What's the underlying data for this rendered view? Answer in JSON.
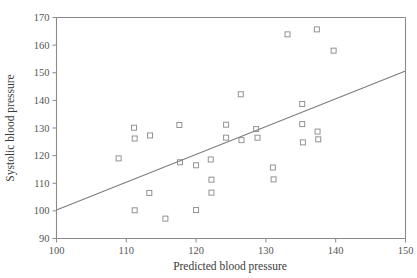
{
  "chart_data": {
    "type": "scatter",
    "title": "",
    "xlabel": "Predicted blood pressure",
    "ylabel": "Systolic blood pressure",
    "xlim": [
      100,
      150
    ],
    "ylim": [
      90,
      170
    ],
    "xticks": [
      100,
      110,
      120,
      130,
      140,
      150
    ],
    "yticks": [
      90,
      100,
      110,
      120,
      130,
      140,
      150,
      160,
      170
    ],
    "xtick_labels": [
      "100",
      "110",
      "120",
      "130",
      "140",
      "150"
    ],
    "ytick_labels": [
      "90",
      "100",
      "110",
      "120",
      "130",
      "140",
      "150",
      "160",
      "170"
    ],
    "grid": false,
    "legend": null,
    "marker_style": "open-square",
    "marker_color": "#8d8d8d",
    "points": [
      {
        "x": 108.9,
        "y": 119.0
      },
      {
        "x": 111.1,
        "y": 130.1
      },
      {
        "x": 111.2,
        "y": 126.2
      },
      {
        "x": 113.4,
        "y": 127.3
      },
      {
        "x": 111.2,
        "y": 100.2
      },
      {
        "x": 113.3,
        "y": 106.5
      },
      {
        "x": 115.6,
        "y": 97.2
      },
      {
        "x": 117.6,
        "y": 131.1
      },
      {
        "x": 117.7,
        "y": 117.6
      },
      {
        "x": 120.0,
        "y": 116.5
      },
      {
        "x": 120.0,
        "y": 100.3
      },
      {
        "x": 122.1,
        "y": 118.6
      },
      {
        "x": 122.2,
        "y": 111.3
      },
      {
        "x": 122.2,
        "y": 106.6
      },
      {
        "x": 124.3,
        "y": 131.2
      },
      {
        "x": 124.3,
        "y": 126.5
      },
      {
        "x": 126.4,
        "y": 142.2
      },
      {
        "x": 126.5,
        "y": 125.6
      },
      {
        "x": 128.6,
        "y": 129.6
      },
      {
        "x": 128.8,
        "y": 126.5
      },
      {
        "x": 131.0,
        "y": 115.7
      },
      {
        "x": 131.1,
        "y": 111.4
      },
      {
        "x": 133.1,
        "y": 163.9
      },
      {
        "x": 135.2,
        "y": 138.7
      },
      {
        "x": 135.2,
        "y": 131.4
      },
      {
        "x": 135.3,
        "y": 124.8
      },
      {
        "x": 137.3,
        "y": 165.7
      },
      {
        "x": 137.4,
        "y": 128.7
      },
      {
        "x": 137.5,
        "y": 125.9
      },
      {
        "x": 139.7,
        "y": 158.0
      }
    ],
    "trend_line": {
      "x": [
        100,
        150
      ],
      "y": [
        100.3,
        150.6
      ],
      "color": "#7b7b7b"
    }
  },
  "colors": {
    "background": "#ffffff",
    "axis": "#8a8a8a",
    "text": "#4a4a4a",
    "marker": "#8d8d8d",
    "line": "#7b7b7b"
  }
}
